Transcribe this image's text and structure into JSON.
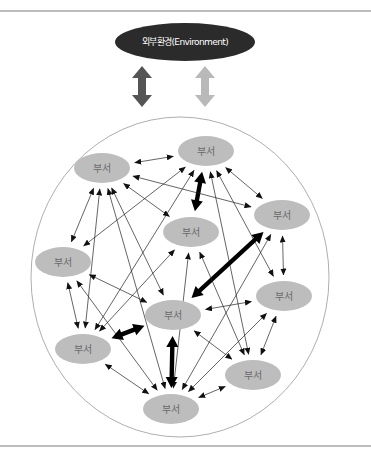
{
  "environment": {
    "label": "외부환경(Environment)",
    "fill": "#2b2b2b",
    "arrow_dark_color": "#555555",
    "arrow_light_color": "#b9b9b9"
  },
  "organization": {
    "node_label": "부서",
    "node_fill": "#bdbdbd",
    "nodes": [
      {
        "id": "A",
        "label": "부서"
      },
      {
        "id": "B",
        "label": "부서"
      },
      {
        "id": "C",
        "label": "부서"
      },
      {
        "id": "D",
        "label": "부서"
      },
      {
        "id": "E",
        "label": "부서"
      },
      {
        "id": "F",
        "label": "부서"
      },
      {
        "id": "G",
        "label": "부서"
      },
      {
        "id": "H",
        "label": "부서"
      },
      {
        "id": "I",
        "label": "부서"
      },
      {
        "id": "J",
        "label": "부서"
      }
    ],
    "links": [
      {
        "from": "A",
        "to": "B",
        "strength": "normal"
      },
      {
        "from": "B",
        "to": "D",
        "strength": "strong"
      },
      {
        "from": "B",
        "to": "C",
        "strength": "normal"
      },
      {
        "from": "A",
        "to": "C",
        "strength": "normal"
      },
      {
        "from": "A",
        "to": "D",
        "strength": "normal"
      },
      {
        "from": "A",
        "to": "E",
        "strength": "normal"
      },
      {
        "from": "A",
        "to": "F",
        "strength": "normal"
      },
      {
        "from": "A",
        "to": "H",
        "strength": "normal"
      },
      {
        "from": "A",
        "to": "J",
        "strength": "normal"
      },
      {
        "from": "B",
        "to": "E",
        "strength": "normal"
      },
      {
        "from": "B",
        "to": "H",
        "strength": "normal"
      },
      {
        "from": "B",
        "to": "G",
        "strength": "normal"
      },
      {
        "from": "B",
        "to": "I",
        "strength": "normal"
      },
      {
        "from": "C",
        "to": "F",
        "strength": "strong"
      },
      {
        "from": "C",
        "to": "G",
        "strength": "normal"
      },
      {
        "from": "C",
        "to": "J",
        "strength": "normal"
      },
      {
        "from": "D",
        "to": "H",
        "strength": "normal"
      },
      {
        "from": "D",
        "to": "J",
        "strength": "normal"
      },
      {
        "from": "D",
        "to": "I",
        "strength": "normal"
      },
      {
        "from": "E",
        "to": "H",
        "strength": "normal"
      },
      {
        "from": "E",
        "to": "F",
        "strength": "normal"
      },
      {
        "from": "E",
        "to": "J",
        "strength": "normal"
      },
      {
        "from": "F",
        "to": "G",
        "strength": "normal"
      },
      {
        "from": "F",
        "to": "H",
        "strength": "strong"
      },
      {
        "from": "F",
        "to": "J",
        "strength": "strong"
      },
      {
        "from": "F",
        "to": "I",
        "strength": "normal"
      },
      {
        "from": "G",
        "to": "I",
        "strength": "normal"
      },
      {
        "from": "G",
        "to": "J",
        "strength": "normal"
      },
      {
        "from": "H",
        "to": "J",
        "strength": "normal"
      },
      {
        "from": "I",
        "to": "J",
        "strength": "normal"
      }
    ]
  }
}
